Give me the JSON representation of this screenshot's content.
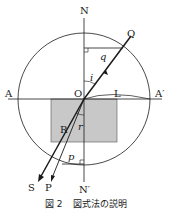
{
  "diagram": {
    "labels": {
      "N": "N",
      "N_prime": "N′",
      "A": "A",
      "A_prime": "A′",
      "O": "O",
      "L": "L",
      "Q": "Q",
      "R": "R",
      "S": "S",
      "P": "P",
      "q": "q",
      "i": "i",
      "r": "r",
      "p": "p"
    },
    "colors": {
      "line": "#1a1a1a",
      "block_fill": "#c8c8c8",
      "background": "#ffffff"
    }
  },
  "caption": {
    "figure_number": "図 2",
    "text": "図式法の説明"
  }
}
